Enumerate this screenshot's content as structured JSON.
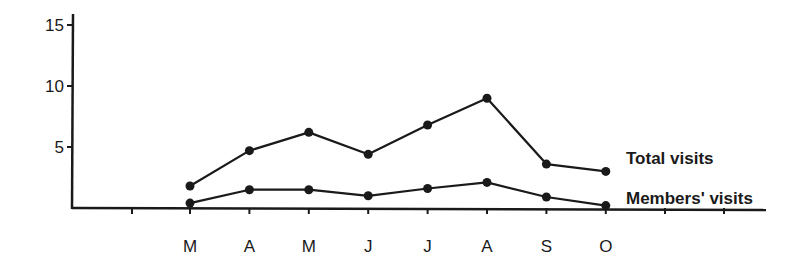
{
  "chart_data": {
    "type": "line",
    "title": "",
    "xlabel": "",
    "ylabel": "",
    "categories": [
      "M",
      "A",
      "M",
      "J",
      "J",
      "A",
      "S",
      "O"
    ],
    "y_ticks": [
      "5",
      "10",
      "15"
    ],
    "ylim": [
      0,
      15
    ],
    "grid": false,
    "legend_position": "inline-right",
    "series": [
      {
        "name": "Total visits",
        "values": [
          1.8,
          4.7,
          6.2,
          4.4,
          6.8,
          9.0,
          3.6,
          3.0
        ]
      },
      {
        "name": "Members' visits",
        "values": [
          0.4,
          1.5,
          1.5,
          1.0,
          1.6,
          2.1,
          0.9,
          0.2
        ]
      }
    ]
  },
  "colors": {
    "ink": "#1a1a1a",
    "background": "#ffffff"
  }
}
